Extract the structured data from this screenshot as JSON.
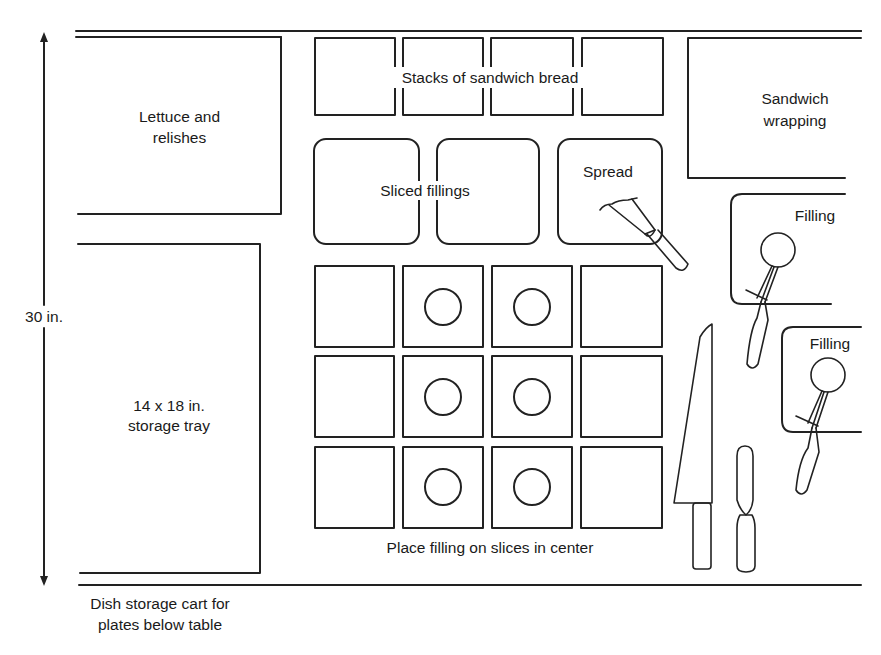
{
  "diagram": {
    "type": "workstation-layout",
    "stroke_color": "#222222",
    "background_color": "#ffffff",
    "dimension": {
      "label": "30 in.",
      "orientation": "vertical"
    },
    "areas": {
      "lettuce": {
        "line1": "Lettuce and",
        "line2": "relishes"
      },
      "storage_tray": {
        "line1": "14 x 18 in.",
        "line2": "storage tray"
      },
      "bread": {
        "label": "Stacks of sandwich bread",
        "count": 4
      },
      "sliced_fillings": {
        "label": "Sliced fillings",
        "count": 2
      },
      "spread": {
        "label": "Spread"
      },
      "wrapping": {
        "line1": "Sandwich",
        "line2": "wrapping"
      },
      "filling_1": {
        "label": "Filling"
      },
      "filling_2": {
        "label": "Filling"
      },
      "slice_grid": {
        "rows": 3,
        "cols": 4,
        "caption": "Place filling on slices in center",
        "filled_columns": [
          1,
          2
        ]
      },
      "cart": {
        "line1": "Dish storage cart for",
        "line2": "plates below table"
      }
    },
    "tools": [
      "spreader-brush",
      "filling-scoop-1",
      "filling-scoop-2",
      "chef-knife",
      "spatula"
    ]
  }
}
